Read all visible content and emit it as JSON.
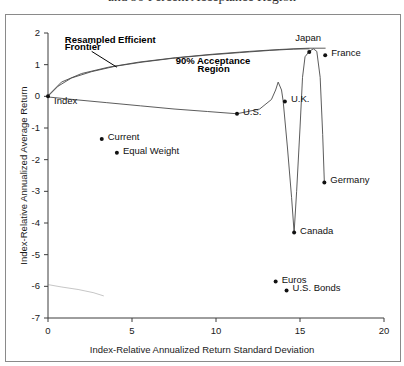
{
  "figure": {
    "title_clipped": "and 90 Percent Acceptance Region"
  },
  "chart_data": {
    "type": "scatter",
    "title": "and 90 Percent Acceptance Region",
    "xlabel": "Index-Relative Annualized Return Standard Deviation",
    "ylabel": "Index-Relative Annualized Average Return",
    "xlim": [
      0,
      20
    ],
    "ylim": [
      -7,
      2
    ],
    "xticks": [
      0,
      5,
      10,
      15,
      20
    ],
    "yticks": [
      2,
      1,
      0,
      -1,
      -2,
      -3,
      -4,
      -5,
      -6,
      -7
    ],
    "xtick_labels": [
      "0",
      "5",
      "10",
      "15",
      "20"
    ],
    "ytick_labels": [
      "2",
      "1",
      "0",
      "-1",
      "-2",
      "-3",
      "-4",
      "-5",
      "-6",
      "-7"
    ],
    "grid": false,
    "legend": "none",
    "points": [
      {
        "label": "Index",
        "x": 0.0,
        "y": 0.0,
        "label_dx": 6,
        "label_dy": 10
      },
      {
        "label": "Current",
        "x": 3.2,
        "y": -1.35,
        "label_dx": 6,
        "label_dy": 3
      },
      {
        "label": "Equal Weight",
        "x": 4.1,
        "y": -1.78,
        "label_dx": 6,
        "label_dy": 3
      },
      {
        "label": "U.S.",
        "x": 11.25,
        "y": -0.55,
        "label_dx": 6,
        "label_dy": 3
      },
      {
        "label": "U.K.",
        "x": 14.1,
        "y": -0.16,
        "label_dx": 6,
        "label_dy": 3
      },
      {
        "label": "Japan",
        "x": 15.55,
        "y": 1.4,
        "label_dx": -14,
        "label_dy": -9
      },
      {
        "label": "France",
        "x": 16.5,
        "y": 1.3,
        "label_dx": 6,
        "label_dy": 3
      },
      {
        "label": "Germany",
        "x": 16.45,
        "y": -2.72,
        "label_dx": 6,
        "label_dy": 3
      },
      {
        "label": "Canada",
        "x": 14.65,
        "y": -4.3,
        "label_dx": 6,
        "label_dy": 3
      },
      {
        "label": "Euros",
        "x": 13.55,
        "y": -5.85,
        "label_dx": 6,
        "label_dy": 3
      },
      {
        "label": "U.S. Bonds",
        "x": 14.2,
        "y": -6.13,
        "label_dx": 6,
        "label_dy": 3
      }
    ],
    "series": [
      {
        "name": "Resampled Efficient Frontier",
        "kind": "line",
        "points": [
          [
            0.0,
            0.0
          ],
          [
            0.6,
            0.32
          ],
          [
            1.4,
            0.58
          ],
          [
            2.6,
            0.78
          ],
          [
            4.0,
            0.95
          ],
          [
            5.6,
            1.08
          ],
          [
            7.4,
            1.2
          ],
          [
            9.4,
            1.3
          ],
          [
            11.4,
            1.38
          ],
          [
            13.2,
            1.45
          ],
          [
            14.6,
            1.49
          ],
          [
            15.55,
            1.5
          ]
        ]
      },
      {
        "name": "90% Acceptance Region Upper Bound",
        "kind": "line",
        "points": [
          [
            0.0,
            0.02
          ],
          [
            0.8,
            0.45
          ],
          [
            2.0,
            0.72
          ],
          [
            3.6,
            0.92
          ],
          [
            5.4,
            1.08
          ],
          [
            7.6,
            1.22
          ],
          [
            9.8,
            1.33
          ],
          [
            12.0,
            1.42
          ],
          [
            13.8,
            1.48
          ],
          [
            15.0,
            1.51
          ],
          [
            15.55,
            1.52
          ],
          [
            16.5,
            1.52
          ]
        ]
      },
      {
        "name": "90% Acceptance Region Lower Bound",
        "kind": "line",
        "points": [
          [
            0.0,
            -0.02
          ],
          [
            1.5,
            -0.1
          ],
          [
            3.5,
            -0.2
          ],
          [
            5.5,
            -0.3
          ],
          [
            7.5,
            -0.4
          ],
          [
            9.5,
            -0.48
          ],
          [
            11.25,
            -0.55
          ],
          [
            12.6,
            -0.4
          ],
          [
            13.3,
            -0.1
          ],
          [
            13.55,
            0.2
          ],
          [
            13.7,
            0.45
          ],
          [
            13.9,
            0.2
          ],
          [
            14.0,
            -0.16
          ],
          [
            14.25,
            -1.6
          ],
          [
            14.5,
            -3.2
          ],
          [
            14.65,
            -4.3
          ],
          [
            14.8,
            -3.0
          ],
          [
            15.0,
            -1.0
          ],
          [
            15.15,
            0.6
          ],
          [
            15.3,
            1.25
          ],
          [
            15.55,
            1.42
          ],
          [
            15.8,
            1.5
          ],
          [
            16.0,
            1.42
          ],
          [
            16.2,
            0.6
          ],
          [
            16.35,
            -1.2
          ],
          [
            16.45,
            -2.72
          ]
        ]
      },
      {
        "name": "Index Reference Line",
        "kind": "line",
        "points": [
          [
            0.05,
            -5.95
          ],
          [
            0.8,
            -6.02
          ],
          [
            1.8,
            -6.1
          ],
          [
            2.7,
            -6.2
          ],
          [
            3.3,
            -6.3
          ]
        ]
      }
    ],
    "annotations": [
      {
        "text": "Resampled Efficient",
        "x": 1.0,
        "y": 1.72,
        "bold": true
      },
      {
        "text": "Frontier",
        "x": 1.0,
        "y": 1.48,
        "bold": true
      },
      {
        "text": "90% Acceptance",
        "x": 7.6,
        "y": 1.05,
        "bold": true
      },
      {
        "text": "Region",
        "x": 8.9,
        "y": 0.8,
        "bold": true
      }
    ],
    "leader_lines": [
      {
        "from": [
          2.6,
          1.42
        ],
        "to": [
          4.1,
          0.92
        ]
      }
    ]
  },
  "colors": {
    "axis": "#3c3c3c",
    "curve": "#4a4a4a",
    "point": "#111111",
    "frame": "#8a8a8a",
    "background": "#ffffff"
  }
}
